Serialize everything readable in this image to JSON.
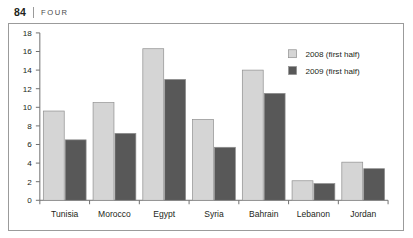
{
  "page_header": {
    "page_number": "84",
    "chapter_name": "FOUR"
  },
  "colors": {
    "series_2008": "#d5d5d5",
    "series_2009": "#585858",
    "bar_outline": "#8f8f8f",
    "axis": "#6f6f6f",
    "frame": "#9b9b9b",
    "text": "#231f20"
  },
  "chart_data": {
    "type": "bar",
    "title": "",
    "xlabel": "",
    "ylabel": "",
    "ylim": [
      0,
      18
    ],
    "yticks": [
      "0",
      "2",
      "4",
      "6",
      "8",
      "10",
      "12",
      "14",
      "16",
      "18"
    ],
    "grid": false,
    "legend_position": "top-right",
    "categories": [
      "Tunisia",
      "Morocco",
      "Egypt",
      "Syria",
      "Bahrain",
      "Lebanon",
      "Jordan"
    ],
    "series": [
      {
        "name": "2008 (first half)",
        "values": [
          9.6,
          10.5,
          16.3,
          8.7,
          14.0,
          2.1,
          4.1
        ]
      },
      {
        "name": "2009 (first half)",
        "values": [
          6.5,
          7.2,
          13.0,
          5.7,
          11.5,
          1.8,
          3.4
        ]
      }
    ]
  }
}
